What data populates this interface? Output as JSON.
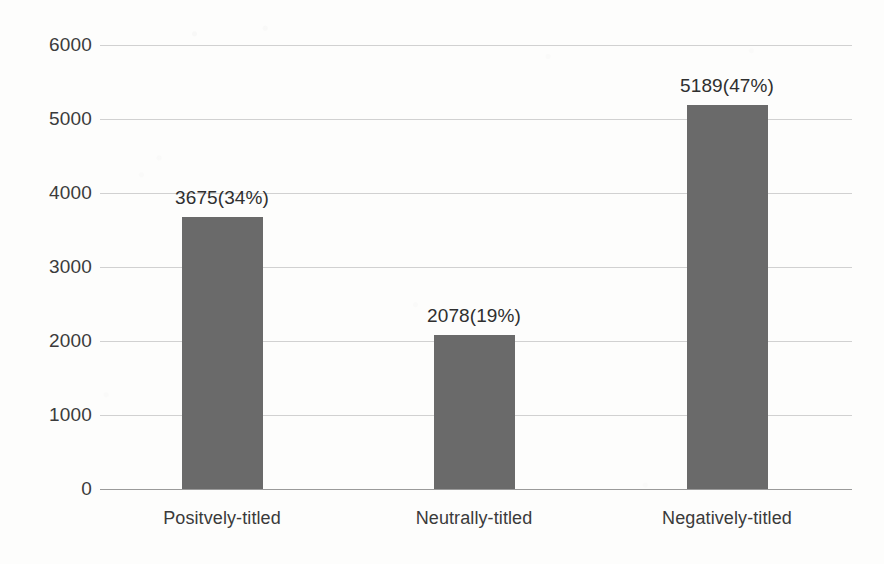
{
  "chart_data": {
    "type": "bar",
    "title": "",
    "subtitle": "",
    "xlabel": "",
    "ylabel": "",
    "categories": [
      "Positvely-titled",
      "Neutrally-titled",
      "Negatively-titled"
    ],
    "values": [
      3675,
      2078,
      5189
    ],
    "percentages": [
      "34%",
      "19%",
      "47%"
    ],
    "data_labels": [
      "3675(34%)",
      "2078(19%)",
      "5189(47%)"
    ],
    "ylim": [
      0,
      6000
    ],
    "yticks": [
      0,
      1000,
      2000,
      3000,
      4000,
      5000,
      6000
    ],
    "ytick_labels": [
      "0",
      "1000",
      "2000",
      "3000",
      "4000",
      "5000",
      "6000"
    ],
    "grid": true,
    "legend": false,
    "legend_position": "none",
    "bar_color": "#6a6a6a",
    "gridline_color": "#c9c9c9",
    "axis_color": "#9a9a9a",
    "background_color": "#fdfdfc",
    "text_color": "#3b3b3b"
  }
}
